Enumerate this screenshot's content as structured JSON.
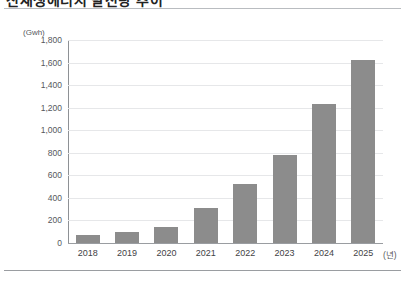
{
  "figure": {
    "title_cropped": "신재생에너지 발전량 추이",
    "unit_label": "(Gwh)",
    "xaxis_unit": "(년)"
  },
  "chart_data": {
    "type": "bar",
    "title": "",
    "xlabel": "(년)",
    "ylabel": "(Gwh)",
    "categories": [
      "2018",
      "2019",
      "2020",
      "2021",
      "2022",
      "2023",
      "2024",
      "2025"
    ],
    "values": [
      70,
      95,
      145,
      310,
      520,
      780,
      1230,
      1620
    ],
    "ylim": [
      0,
      1800
    ],
    "ytick_labels": [
      "1,800",
      "1,600",
      "1,400",
      "1,200",
      "1,000",
      "800",
      "600",
      "400",
      "200",
      "0"
    ],
    "ytick_values": [
      1800,
      1600,
      1400,
      1200,
      1000,
      800,
      600,
      400,
      200,
      0
    ],
    "grid": true,
    "legend": false,
    "bar_color": "#8c8c8c",
    "gridline_color": "#e6e7e9",
    "axis_color": "#8e9195"
  }
}
